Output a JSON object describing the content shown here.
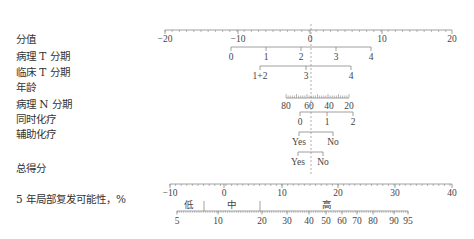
{
  "chart_data": {
    "type": "nomogram",
    "title": "",
    "reference_line": {
      "points_value": 0,
      "style": "dashed",
      "x_px": 311
    },
    "rows": [
      {
        "label": "分值",
        "kind": "points_axis",
        "ticks": [
          -20,
          -10,
          0,
          10,
          20
        ],
        "range": [
          -20,
          20
        ]
      },
      {
        "label": "病理 T 分期",
        "kind": "variable",
        "levels": [
          "0",
          "1",
          "2",
          "3",
          "4"
        ],
        "points_range": [
          -11,
          8
        ]
      },
      {
        "label": "临床 T 分期",
        "kind": "variable",
        "levels": [
          "1+2",
          "3",
          "4"
        ],
        "points_range": [
          -7,
          6
        ]
      },
      {
        "label": "年龄",
        "kind": "variable",
        "levels": [
          "80",
          "60",
          "40",
          "20"
        ],
        "points_range": [
          -3.5,
          5
        ]
      },
      {
        "label": "病理 N 分期",
        "kind": "variable",
        "levels": [
          "0",
          "1",
          "2"
        ],
        "points_range": [
          -1.5,
          6
        ]
      },
      {
        "label": "同时化疗",
        "kind": "variable",
        "levels": [
          "Yes",
          "No"
        ],
        "points_range": [
          -1.5,
          3
        ]
      },
      {
        "label": "辅助化疗",
        "kind": "variable",
        "levels": [
          "Yes",
          "No"
        ],
        "points_range": [
          -2,
          2
        ]
      },
      {
        "label": "总得分",
        "kind": "total_points_axis",
        "ticks": [
          -10,
          0,
          10,
          20,
          30,
          40
        ],
        "range": [
          -10,
          40
        ]
      },
      {
        "label": "5 年局部复发可能性，%",
        "kind": "probability_axis",
        "ticks": [
          5,
          10,
          20,
          30,
          40,
          50,
          60,
          70,
          80,
          90,
          95
        ],
        "risk_groups": [
          "低",
          "中",
          "高"
        ]
      }
    ]
  },
  "labels": {
    "points": "分值",
    "path_t": "病理 T 分期",
    "clin_t": "临床 T 分期",
    "age": "年龄",
    "path_n": "病理 N 分期",
    "concurrent_chemo": "同时化疗",
    "adjuvant_chemo": "辅助化疗",
    "total_points": "总得分",
    "recurrence": "5 年局部复发可能性，%"
  },
  "axes": {
    "points": {
      "y": 30,
      "ticks": [
        {
          "v": "−20",
          "x": 165
        },
        {
          "v": "−10",
          "x": 238
        },
        {
          "v": "0",
          "x": 310
        },
        {
          "v": "10",
          "x": 382
        },
        {
          "v": "20",
          "x": 452
        }
      ]
    },
    "path_t": {
      "y": 47,
      "ticks": [
        {
          "v": "0",
          "x": 231
        },
        {
          "v": "1",
          "x": 266
        },
        {
          "v": "2",
          "x": 301
        },
        {
          "v": "3",
          "x": 336
        },
        {
          "v": "4",
          "x": 371
        }
      ]
    },
    "clin_t": {
      "y": 66,
      "ticks": [
        {
          "v": "1+2",
          "x": 260
        },
        {
          "v": "3",
          "x": 306
        },
        {
          "v": "4",
          "x": 351
        }
      ]
    },
    "age": {
      "y": 98,
      "ticks": [
        {
          "v": "80",
          "x": 286
        },
        {
          "v": "60",
          "x": 309
        },
        {
          "v": "40",
          "x": 329
        },
        {
          "v": "20",
          "x": 349
        }
      ]
    },
    "path_n": {
      "y": 112,
      "ticks": [
        {
          "v": "0",
          "x": 300
        },
        {
          "v": "1",
          "x": 327
        },
        {
          "v": "2",
          "x": 353
        }
      ]
    },
    "concurrent": {
      "y": 132,
      "ticks": [
        {
          "v": "Yes",
          "x": 299
        },
        {
          "v": "No",
          "x": 333
        }
      ]
    },
    "adjuvant": {
      "y": 152,
      "ticks": [
        {
          "v": "Yes",
          "x": 298
        },
        {
          "v": "No",
          "x": 323
        }
      ]
    },
    "total": {
      "y": 184,
      "ticks": [
        {
          "v": "−10",
          "x": 170
        },
        {
          "v": "0",
          "x": 224
        },
        {
          "v": "10",
          "x": 282
        },
        {
          "v": "20",
          "x": 338
        },
        {
          "v": "30",
          "x": 395
        },
        {
          "v": "40",
          "x": 452
        }
      ]
    },
    "prob": {
      "y": 211,
      "ticks": [
        {
          "v": "5",
          "x": 177
        },
        {
          "v": "10",
          "x": 218
        },
        {
          "v": "20",
          "x": 262
        },
        {
          "v": "30",
          "x": 287
        },
        {
          "v": "40",
          "x": 309
        },
        {
          "v": "50",
          "x": 326
        },
        {
          "v": "60",
          "x": 342
        },
        {
          "v": "70",
          "x": 357
        },
        {
          "v": "80",
          "x": 373
        },
        {
          "v": "90",
          "x": 394
        },
        {
          "v": "95",
          "x": 408
        }
      ],
      "groups": [
        {
          "v": "低",
          "x": 189
        },
        {
          "v": "中",
          "x": 232
        },
        {
          "v": "高",
          "x": 327
        }
      ],
      "separators": [
        204,
        260
      ]
    }
  }
}
